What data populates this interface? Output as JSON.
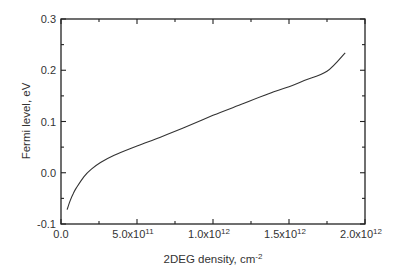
{
  "chart_data": {
    "type": "line",
    "title": "",
    "xlabel": "2DEG density, cm",
    "xlabel_superscript": "-2",
    "ylabel": "Fermi level, eV",
    "xlim": [
      0,
      2000000000000.0
    ],
    "ylim": [
      -0.1,
      0.3
    ],
    "x_ticks": [
      {
        "value": 0,
        "label": "0.0",
        "exp": ""
      },
      {
        "value": 500000000000.0,
        "label": "5.0x10",
        "exp": "11"
      },
      {
        "value": 1000000000000.0,
        "label": "1.0x10",
        "exp": "12"
      },
      {
        "value": 1500000000000.0,
        "label": "1.5x10",
        "exp": "12"
      },
      {
        "value": 2000000000000.0,
        "label": "2.0x10",
        "exp": "12"
      }
    ],
    "x_minor_ticks": [
      250000000000.0,
      750000000000.0,
      1250000000000.0,
      1750000000000.0
    ],
    "y_ticks": [
      {
        "value": -0.1,
        "label": "-0.1"
      },
      {
        "value": 0.0,
        "label": "0.0"
      },
      {
        "value": 0.1,
        "label": "0.1"
      },
      {
        "value": 0.2,
        "label": "0.2"
      },
      {
        "value": 0.3,
        "label": "0.3"
      }
    ],
    "y_minor_ticks": [
      -0.05,
      0.05,
      0.15,
      0.25
    ],
    "grid": false,
    "legend": null,
    "series": [
      {
        "name": "Fermi level",
        "color": "#333333",
        "x": [
          40000000000.0,
          60000000000.0,
          80000000000.0,
          100000000000.0,
          150000000000.0,
          200000000000.0,
          260000000000.0,
          350000000000.0,
          500000000000.0,
          650000000000.0,
          800000000000.0,
          1000000000000.0,
          1200000000000.0,
          1400000000000.0,
          1500000000000.0,
          1600000000000.0,
          1750000000000.0,
          1870000000000.0
        ],
        "values": [
          -0.072,
          -0.055,
          -0.041,
          -0.03,
          -0.008,
          0.007,
          0.02,
          0.034,
          0.052,
          0.069,
          0.087,
          0.112,
          0.135,
          0.158,
          0.168,
          0.18,
          0.198,
          0.234
        ]
      }
    ]
  }
}
